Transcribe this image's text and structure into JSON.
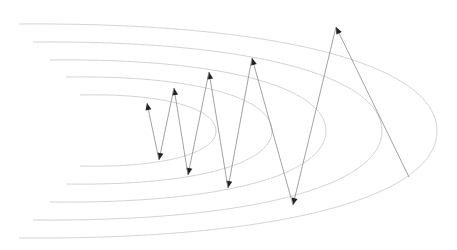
{
  "diagram": {
    "title": "",
    "colors": {
      "background": "#ffffff",
      "contour": "#d4d4d4",
      "path_line": "#8a8a8a",
      "arrowhead": "#222222"
    },
    "contours": [
      {
        "id": "contour-1",
        "left_x": 80,
        "top_y": 95,
        "bottom_y": 166,
        "right_x": 216,
        "center_y": 131
      },
      {
        "id": "contour-2",
        "left_x": 66,
        "top_y": 77,
        "bottom_y": 184,
        "right_x": 272,
        "center_y": 131
      },
      {
        "id": "contour-3",
        "left_x": 50,
        "top_y": 60,
        "bottom_y": 202,
        "right_x": 326,
        "center_y": 131
      },
      {
        "id": "contour-4",
        "left_x": 33,
        "top_y": 42,
        "bottom_y": 220,
        "right_x": 382,
        "center_y": 131
      },
      {
        "id": "contour-5",
        "left_x": 19,
        "top_y": 24,
        "bottom_y": 238,
        "right_x": 437,
        "center_y": 131
      }
    ],
    "path": {
      "start": [
        409,
        177
      ],
      "points": [
        [
          409,
          177
        ],
        [
          336,
          27
        ],
        [
          293,
          205
        ],
        [
          252,
          58
        ],
        [
          228,
          188
        ],
        [
          209,
          72
        ],
        [
          188,
          175
        ],
        [
          174,
          88
        ],
        [
          159,
          160
        ],
        [
          147,
          103
        ]
      ],
      "end": [
        147,
        103
      ],
      "arrowheads_at_each_step": true
    }
  }
}
